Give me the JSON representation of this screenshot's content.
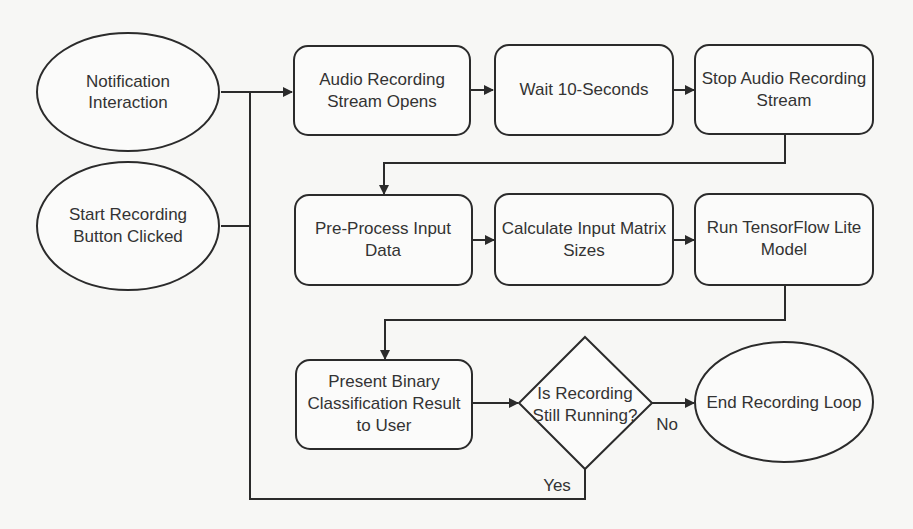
{
  "diagram": {
    "type": "flowchart",
    "nodes": {
      "notification": {
        "shape": "ellipse",
        "lines": [
          "Notification",
          "Interaction"
        ]
      },
      "start_button": {
        "shape": "ellipse",
        "lines": [
          "Start Recording",
          "Button Clicked"
        ]
      },
      "audio_open": {
        "shape": "rounded-rect",
        "lines": [
          "Audio Recording",
          "Stream Opens"
        ]
      },
      "wait": {
        "shape": "rounded-rect",
        "lines": [
          "Wait 10-Seconds"
        ]
      },
      "audio_stop": {
        "shape": "rounded-rect",
        "lines": [
          "Stop Audio Recording",
          "Stream"
        ]
      },
      "preprocess": {
        "shape": "rounded-rect",
        "lines": [
          "Pre-Process Input",
          "Data"
        ]
      },
      "calc_sizes": {
        "shape": "rounded-rect",
        "lines": [
          "Calculate Input Matrix",
          "Sizes"
        ]
      },
      "run_model": {
        "shape": "rounded-rect",
        "lines": [
          "Run TensorFlow Lite",
          "Model"
        ]
      },
      "present": {
        "shape": "rounded-rect",
        "lines": [
          "Present Binary",
          "Classification Result",
          "to User"
        ]
      },
      "decision": {
        "shape": "diamond",
        "lines": [
          "Is Recording",
          "Still Running?"
        ]
      },
      "end_loop": {
        "shape": "ellipse",
        "lines": [
          "End Recording Loop"
        ]
      }
    },
    "edges": [
      {
        "from": "notification",
        "to": "audio_open",
        "label": ""
      },
      {
        "from": "start_button",
        "to": "audio_open",
        "label": ""
      },
      {
        "from": "audio_open",
        "to": "wait",
        "label": ""
      },
      {
        "from": "wait",
        "to": "audio_stop",
        "label": ""
      },
      {
        "from": "audio_stop",
        "to": "preprocess",
        "label": ""
      },
      {
        "from": "preprocess",
        "to": "calc_sizes",
        "label": ""
      },
      {
        "from": "calc_sizes",
        "to": "run_model",
        "label": ""
      },
      {
        "from": "run_model",
        "to": "present",
        "label": ""
      },
      {
        "from": "present",
        "to": "decision",
        "label": ""
      },
      {
        "from": "decision",
        "to": "end_loop",
        "label": "No"
      },
      {
        "from": "decision",
        "to": "audio_open",
        "label": "Yes"
      }
    ],
    "edge_labels": {
      "no": "No",
      "yes": "Yes"
    }
  }
}
